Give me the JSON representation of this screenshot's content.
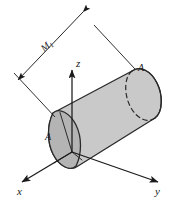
{
  "figure": {
    "name": "cylinder-axes-diagram",
    "type": "3d-engineering-sketch",
    "background_color": "#ffffff",
    "line_color": "#1a1a1a",
    "body_fill": "#c9c9c9",
    "endcap_fill": "#b4b4b4",
    "highlight_fill": "#d2d2d2"
  },
  "axes": {
    "x_label": "x",
    "y_label": "y",
    "z_label": "z",
    "origin_label": ""
  },
  "annotations": {
    "area_left_label": "A",
    "area_right_label": "A",
    "dimension_label_main": "M",
    "dimension_label_sub": "1"
  }
}
